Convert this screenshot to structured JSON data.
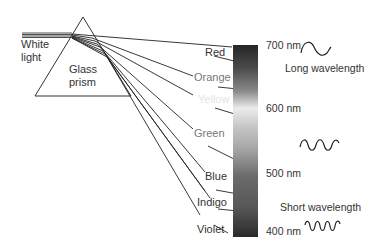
{
  "diagram": {
    "source_label": [
      "White",
      "light"
    ],
    "prism_label": [
      "Glass",
      "prism"
    ],
    "colors": [
      {
        "name": "Red",
        "text_color": "#333333"
      },
      {
        "name": "Orange",
        "text_color": "#777777"
      },
      {
        "name": "Yellow",
        "text_color": "#e6e6e6"
      },
      {
        "name": "Green",
        "text_color": "#777777"
      },
      {
        "name": "Blue",
        "text_color": "#333333"
      },
      {
        "name": "Indigo",
        "text_color": "#333333"
      },
      {
        "name": "Violet",
        "text_color": "#333333"
      }
    ],
    "wavelength_ticks": [
      {
        "label": "700 nm",
        "value": 700
      },
      {
        "label": "600 nm",
        "value": 600
      },
      {
        "label": "500 nm",
        "value": 500
      },
      {
        "label": "400 nm",
        "value": 400
      }
    ],
    "long_wave_label": "Long wavelength",
    "short_wave_label": "Short wavelength",
    "spectrum_gradient": [
      "#2a2a2a",
      "#5a5a5a",
      "#e6e6e6",
      "#b8b8b8",
      "#6e6e6e",
      "#5a5a5a",
      "#2c2c2c"
    ]
  }
}
